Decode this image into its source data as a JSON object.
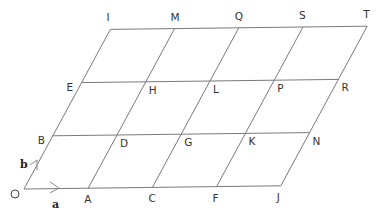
{
  "diagram": {
    "type": "parallelogram-lattice",
    "origin_label": "O",
    "vectors": {
      "a": "a",
      "b": "b"
    },
    "geometry": {
      "origin_px": [
        24,
        189
      ],
      "a_px": [
        64.2,
        -0.8
      ],
      "b_px": [
        28.8,
        -53.2
      ],
      "cols": 4,
      "rows": 3
    },
    "points": [
      {
        "label": "O",
        "i": 0,
        "j": 0
      },
      {
        "label": "A",
        "i": 1,
        "j": 0
      },
      {
        "label": "C",
        "i": 2,
        "j": 0
      },
      {
        "label": "F",
        "i": 3,
        "j": 0
      },
      {
        "label": "J",
        "i": 4,
        "j": 0
      },
      {
        "label": "B",
        "i": 0,
        "j": 1
      },
      {
        "label": "D",
        "i": 1,
        "j": 1
      },
      {
        "label": "G",
        "i": 2,
        "j": 1
      },
      {
        "label": "K",
        "i": 3,
        "j": 1
      },
      {
        "label": "N",
        "i": 4,
        "j": 1
      },
      {
        "label": "E",
        "i": 0,
        "j": 2
      },
      {
        "label": "H",
        "i": 1,
        "j": 2
      },
      {
        "label": "L",
        "i": 2,
        "j": 2
      },
      {
        "label": "P",
        "i": 3,
        "j": 2
      },
      {
        "label": "R",
        "i": 4,
        "j": 2
      },
      {
        "label": "I",
        "i": 0,
        "j": 3
      },
      {
        "label": "M",
        "i": 1,
        "j": 3
      },
      {
        "label": "Q",
        "i": 2,
        "j": 3
      },
      {
        "label": "S",
        "i": 3,
        "j": 3
      },
      {
        "label": "T",
        "i": 4,
        "j": 3
      }
    ],
    "colors": {
      "line": "#7a7a7a",
      "text": "#333333"
    }
  }
}
